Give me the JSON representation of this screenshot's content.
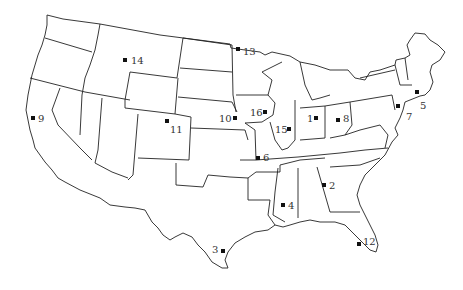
{
  "map": {
    "title": "",
    "region": "Contiguous United States",
    "marker_color": "#111111",
    "border_color": "#222222",
    "markers": [
      {
        "id": "1",
        "label": "1",
        "x": 316,
        "y": 118,
        "lx": 307,
        "ly": 122
      },
      {
        "id": "2",
        "label": "2",
        "x": 324,
        "y": 185,
        "lx": 329,
        "ly": 189
      },
      {
        "id": "3",
        "label": "3",
        "x": 223,
        "y": 251,
        "lx": 212,
        "ly": 253
      },
      {
        "id": "4",
        "label": "4",
        "x": 283,
        "y": 205,
        "lx": 288,
        "ly": 209
      },
      {
        "id": "5",
        "label": "5",
        "x": 417,
        "y": 92,
        "lx": 420,
        "ly": 109
      },
      {
        "id": "6",
        "label": "6",
        "x": 258,
        "y": 158,
        "lx": 263,
        "ly": 161
      },
      {
        "id": "7",
        "label": "7",
        "x": 398,
        "y": 106,
        "lx": 406,
        "ly": 120
      },
      {
        "id": "8",
        "label": "8",
        "x": 338,
        "y": 120,
        "lx": 343,
        "ly": 122
      },
      {
        "id": "9",
        "label": "9",
        "x": 33,
        "y": 118,
        "lx": 38,
        "ly": 122
      },
      {
        "id": "10",
        "label": "10",
        "x": 235,
        "y": 118,
        "lx": 219,
        "ly": 122
      },
      {
        "id": "11",
        "label": "11",
        "x": 167,
        "y": 121,
        "lx": 170,
        "ly": 133
      },
      {
        "id": "12",
        "label": "12",
        "x": 359,
        "y": 244,
        "lx": 363,
        "ly": 245
      },
      {
        "id": "13",
        "label": "13",
        "x": 238,
        "y": 49,
        "lx": 243,
        "ly": 55
      },
      {
        "id": "14",
        "label": "14",
        "x": 125,
        "y": 60,
        "lx": 131,
        "ly": 64
      },
      {
        "id": "15",
        "label": "15",
        "x": 289,
        "y": 129,
        "lx": 275,
        "ly": 133
      },
      {
        "id": "16",
        "label": "16",
        "x": 265,
        "y": 112,
        "lx": 250,
        "ly": 116
      }
    ]
  }
}
